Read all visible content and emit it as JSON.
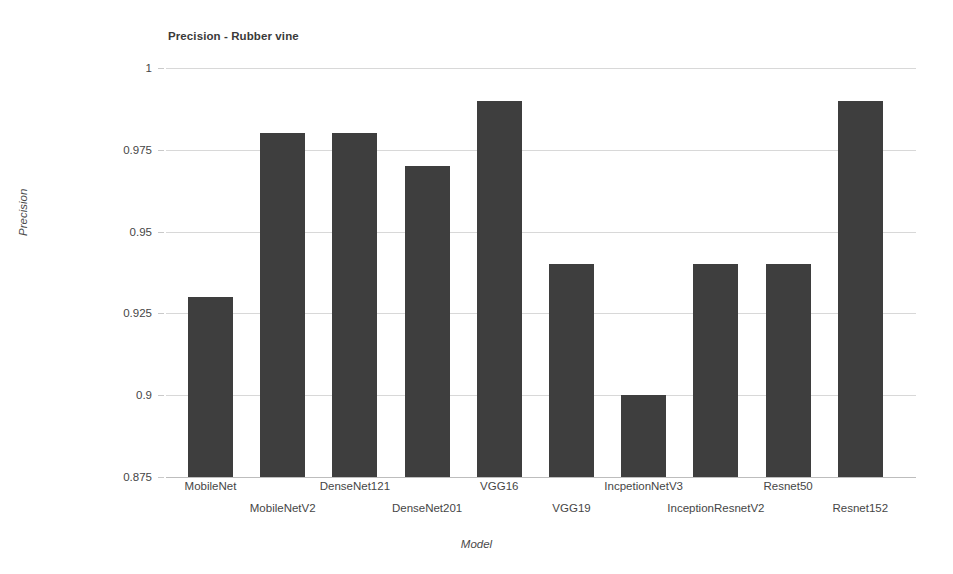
{
  "chart_data": {
    "type": "bar",
    "title": "Precision - Rubber vine",
    "xlabel": "Model",
    "ylabel": "Precision",
    "categories": [
      "MobileNet",
      "MobileNetV2",
      "DenseNet121",
      "DenseNet201",
      "VGG16",
      "VGG19",
      "IncpetionNetV3",
      "InceptionResnetV2",
      "Resnet50",
      "Resnet152"
    ],
    "values": [
      0.93,
      0.98,
      0.98,
      0.97,
      0.99,
      0.94,
      0.9,
      0.94,
      0.94,
      0.99
    ],
    "ylim": [
      0.875,
      1
    ],
    "yticks": [
      0.875,
      0.9,
      0.925,
      0.95,
      0.975,
      1
    ],
    "ytick_labels": [
      "0.875",
      "0.9",
      "0.925",
      "0.95",
      "0.975",
      "1"
    ],
    "grid": true,
    "legend": false,
    "bar_color": "#3e3e3e",
    "grid_color": "#d8d8d8",
    "background": "#ffffff"
  }
}
